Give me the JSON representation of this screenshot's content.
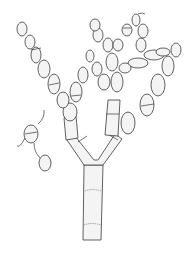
{
  "figure": {
    "colors": {
      "stroke": "#3a3a3a",
      "fill": "#f4f4f4",
      "background": "#ffffff"
    }
  }
}
